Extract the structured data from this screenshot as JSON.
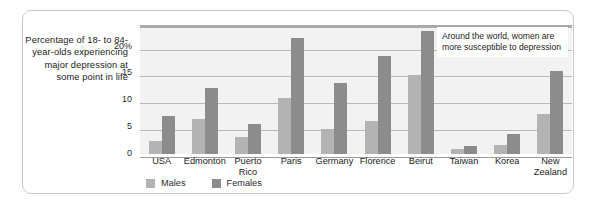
{
  "caption": {
    "text": "Percentage of 18- to 84-year-olds experiencing major depression at some point in life"
  },
  "annotation": {
    "text": "Around the world, women are more susceptible to depression"
  },
  "legend": {
    "males_label": "Males",
    "females_label": "Females"
  },
  "colors": {
    "males": "#b3b3b3",
    "females": "#8c8c8c",
    "plot_background": "#f2f2f2",
    "gridline": "#b9b9b9",
    "panel_border": "#c9c9c9"
  },
  "chart_data": {
    "type": "bar",
    "title": "Percentage of 18- to 84-year-olds experiencing major depression at some point in life",
    "xlabel": "",
    "ylabel": "",
    "ylim": [
      0,
      24
    ],
    "yticks": [
      "0",
      "5",
      "10",
      "15",
      "20%"
    ],
    "ytick_values": [
      0,
      5,
      10,
      15,
      20
    ],
    "grid": true,
    "legend_position": "bottom-left",
    "categories": [
      "USA",
      "Edmonton",
      "Puerto Rico",
      "Paris",
      "Germany",
      "Florence",
      "Beirut",
      "Taiwan",
      "Korea",
      "New Zealand"
    ],
    "series": [
      {
        "name": "Males",
        "values": [
          2.5,
          6.5,
          3.2,
          10.5,
          4.6,
          6.2,
          14.7,
          1.0,
          1.7,
          7.5
        ]
      },
      {
        "name": "Females",
        "values": [
          7.0,
          12.3,
          5.5,
          21.5,
          13.3,
          18.2,
          22.8,
          1.5,
          3.7,
          15.5
        ]
      }
    ],
    "annotations": [
      "Around the world, women are more susceptible to depression"
    ]
  }
}
